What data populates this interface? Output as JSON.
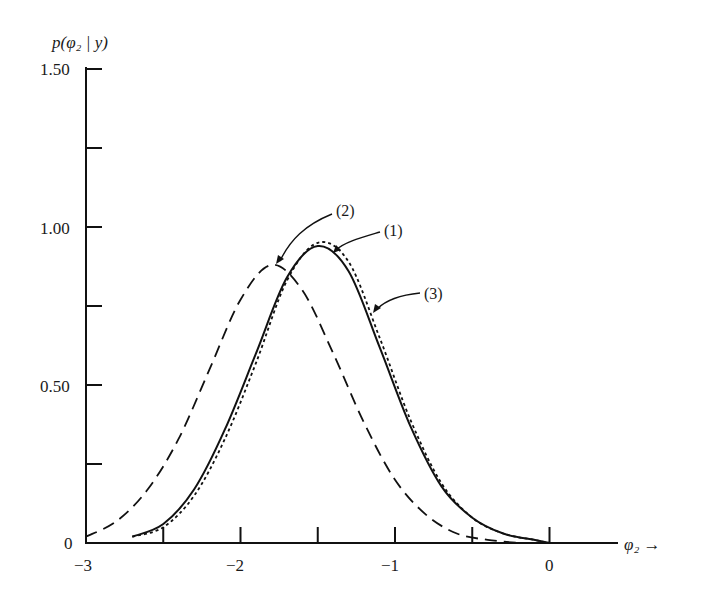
{
  "chart_data": {
    "type": "line",
    "title": "",
    "xlabel": "φ₂ →",
    "ylabel": "p(φ₂ | y)",
    "xlim": [
      -3,
      0.4
    ],
    "ylim": [
      0,
      1.5
    ],
    "grid": false,
    "legend": "none (curves annotated with arrows)",
    "x_ticks": [
      -3,
      -2.5,
      -2,
      -1.5,
      -1,
      -0.5,
      0
    ],
    "x_tick_labels": [
      "−3",
      "",
      "−2",
      "",
      "−1",
      "",
      "0"
    ],
    "y_ticks": [
      0,
      0.25,
      0.5,
      0.75,
      1.0,
      1.25,
      1.5
    ],
    "y_tick_labels": [
      "0",
      "",
      "0.50",
      "",
      "1.00",
      "",
      "1.50"
    ],
    "series": [
      {
        "name": "(1)",
        "style": "solid",
        "x": [
          -2.7,
          -2.5,
          -2.3,
          -2.1,
          -1.9,
          -1.7,
          -1.5,
          -1.3,
          -1.1,
          -0.9,
          -0.7,
          -0.5,
          -0.3,
          -0.1,
          0
        ],
        "values": [
          0.02,
          0.06,
          0.17,
          0.36,
          0.6,
          0.84,
          0.94,
          0.86,
          0.62,
          0.37,
          0.18,
          0.08,
          0.03,
          0.01,
          0.0
        ]
      },
      {
        "name": "(2)",
        "style": "dashed",
        "x": [
          -3.0,
          -2.8,
          -2.6,
          -2.4,
          -2.2,
          -2.0,
          -1.8,
          -1.6,
          -1.4,
          -1.2,
          -1.0,
          -0.8,
          -0.6,
          -0.4,
          -0.2
        ],
        "values": [
          0.02,
          0.07,
          0.17,
          0.33,
          0.55,
          0.77,
          0.88,
          0.8,
          0.6,
          0.38,
          0.2,
          0.09,
          0.03,
          0.01,
          0.0
        ]
      },
      {
        "name": "(3)",
        "style": "dotted",
        "x": [
          -2.7,
          -2.5,
          -2.3,
          -2.1,
          -1.9,
          -1.7,
          -1.5,
          -1.3,
          -1.1,
          -0.9,
          -0.7,
          -0.5,
          -0.3,
          -0.1,
          0
        ],
        "values": [
          0.02,
          0.05,
          0.15,
          0.33,
          0.57,
          0.83,
          0.95,
          0.89,
          0.65,
          0.39,
          0.19,
          0.08,
          0.03,
          0.01,
          0.0
        ]
      }
    ],
    "annotations": [
      {
        "text": "(1)",
        "points_to": [
          -1.42,
          0.92
        ]
      },
      {
        "text": "(2)",
        "points_to": [
          -1.78,
          0.88
        ]
      },
      {
        "text": "(3)",
        "points_to": [
          -1.17,
          0.78
        ]
      }
    ]
  },
  "labels": {
    "ylabel": "p(φ₂ | y)",
    "xlabel": "φ₂ →",
    "yt0": "0",
    "yt50": "0.50",
    "yt100": "1.00",
    "yt150": "1.50",
    "xtm3": "−3",
    "xtm2": "−2",
    "xtm1": "−1",
    "xt0": "0",
    "a1": "(1)",
    "a2": "(2)",
    "a3": "(3)"
  }
}
